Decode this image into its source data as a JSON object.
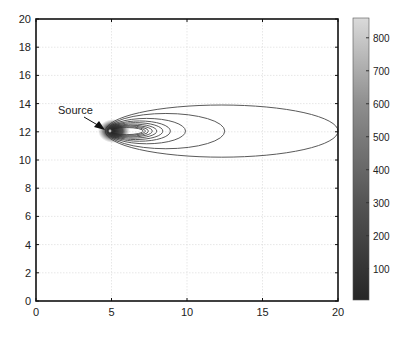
{
  "chart_data": {
    "type": "contour",
    "title": "",
    "xlabel": "",
    "ylabel": "",
    "xlim": [
      0,
      20
    ],
    "ylim": [
      0,
      20
    ],
    "x_ticks": [
      0,
      5,
      10,
      15,
      20
    ],
    "y_ticks": [
      0,
      2,
      4,
      6,
      8,
      10,
      12,
      14,
      16,
      18,
      20
    ],
    "grid": true,
    "source": {
      "x": 5,
      "y": 12,
      "label": "Source"
    },
    "contours": [
      {
        "x_left": 4.6,
        "x_right": 20.0,
        "y_center": 12.05,
        "half_height": 1.85
      },
      {
        "x_left": 4.7,
        "x_right": 12.5,
        "y_center": 12.05,
        "half_height": 1.25
      },
      {
        "x_left": 4.75,
        "x_right": 9.9,
        "y_center": 12.05,
        "half_height": 0.9
      },
      {
        "x_left": 4.8,
        "x_right": 8.9,
        "y_center": 12.05,
        "half_height": 0.72
      },
      {
        "x_left": 4.8,
        "x_right": 8.4,
        "y_center": 12.05,
        "half_height": 0.6
      },
      {
        "x_left": 4.85,
        "x_right": 8.0,
        "y_center": 12.05,
        "half_height": 0.5
      },
      {
        "x_left": 4.85,
        "x_right": 7.7,
        "y_center": 12.05,
        "half_height": 0.42
      },
      {
        "x_left": 4.9,
        "x_right": 7.45,
        "y_center": 12.05,
        "half_height": 0.36
      },
      {
        "x_left": 4.9,
        "x_right": 7.25,
        "y_center": 12.05,
        "half_height": 0.3
      },
      {
        "x_left": 4.92,
        "x_right": 7.1,
        "y_center": 12.05,
        "half_height": 0.25
      }
    ],
    "colorbar": {
      "range": [
        5,
        860
      ],
      "ticks": [
        100,
        200,
        300,
        400,
        500,
        600,
        700,
        800
      ],
      "colormap": "gray",
      "color_low": "#2a2a2a",
      "color_high": "#d8d8d8"
    }
  },
  "annotation": {
    "text": "Source"
  }
}
